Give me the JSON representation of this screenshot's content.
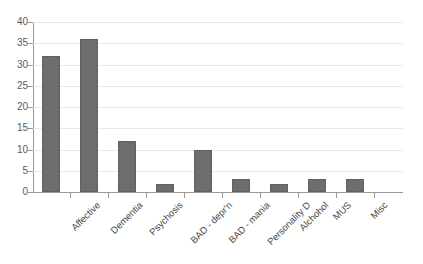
{
  "chart_data": {
    "type": "bar",
    "title": "",
    "subtitle": "",
    "xlabel": "",
    "ylabel": "",
    "categories": [
      "Affective",
      "Dementia",
      "Psychosis",
      "BAD - depr'n",
      "BAD - mania",
      "Personality D",
      "Alchohol",
      "MUS",
      "Misc"
    ],
    "values": [
      32,
      36,
      12,
      2,
      10,
      3,
      2,
      3,
      3
    ],
    "ylim": [
      0,
      40
    ],
    "ytick_step": 5,
    "yticks": [
      0,
      5,
      10,
      15,
      20,
      25,
      30,
      35,
      40
    ],
    "ytick_labels": [
      "0",
      "5",
      "10",
      "15",
      "20",
      "25",
      "30",
      "35",
      "40"
    ],
    "grid": true,
    "grid_axis": "y",
    "legend": false,
    "legend_position": "none",
    "series": [
      {
        "name": "Count",
        "values": [
          32,
          36,
          12,
          2,
          10,
          3,
          2,
          3,
          3
        ]
      }
    ],
    "annotations": []
  },
  "style": {
    "bar_color": "#6d6d6d",
    "bar_border_color": "#606060",
    "grid_color": "#e9e9e9",
    "axis_color": "#9a9a9a",
    "tick_label_color": "#5a5a5a",
    "category_label_color": "#4a4a4a",
    "background": "#ffffff"
  }
}
